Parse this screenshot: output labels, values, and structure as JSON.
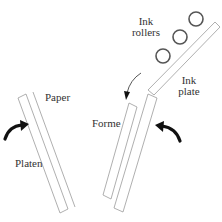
{
  "diagram": {
    "labels": {
      "paper": "Paper",
      "platen": "Platen",
      "forme": "Forme",
      "ink_rollers_line1": "Ink",
      "ink_rollers_line2": "rollers",
      "ink_plate_line1": "Ink",
      "ink_plate_line2": "plate"
    },
    "components": [
      {
        "name": "Platen",
        "shape": "thin-rectangle",
        "motion": "rotates up toward forme"
      },
      {
        "name": "Paper",
        "shape": "line",
        "position": "on platen"
      },
      {
        "name": "Forme",
        "shape": "stacked-rectangles",
        "motion": "rotates toward platen"
      },
      {
        "name": "Ink plate",
        "shape": "long-thin-rectangle"
      },
      {
        "name": "Ink rollers",
        "shape": "circle",
        "count": 3
      }
    ],
    "arrows": [
      {
        "id": "platen-arrow",
        "direction": "curved up-right"
      },
      {
        "id": "forme-arrow",
        "direction": "curved up-left"
      },
      {
        "id": "roller-arrow",
        "direction": "curved down"
      }
    ],
    "colors": {
      "outline": "#9a9a9a",
      "roller": "#555555",
      "arrow": "#111111",
      "text": "#333333",
      "background": "#ffffff"
    }
  }
}
